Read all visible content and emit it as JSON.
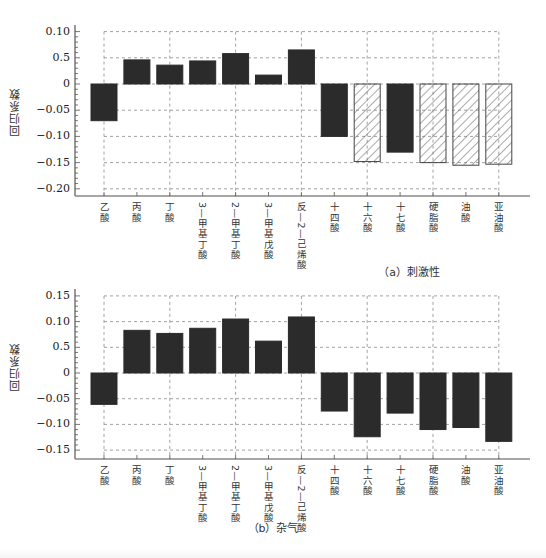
{
  "chart_data": [
    {
      "type": "bar",
      "title": "(a) 刺激性",
      "xlabel": "",
      "ylabel": "回归系数",
      "categories": [
        "乙酸",
        "丙酸",
        "丁酸",
        "3-甲基丁酸",
        "2-甲基丁酸",
        "3-甲基戊酸",
        "反-2-己烯酸",
        "十四酸",
        "十六酸",
        "十七酸",
        "硬脂酸",
        "油酸",
        "亚油酸"
      ],
      "values": [
        -0.07,
        0.046,
        0.036,
        0.044,
        0.058,
        0.017,
        0.065,
        -0.1,
        -0.148,
        -0.13,
        -0.15,
        -0.155,
        -0.153
      ],
      "bar_style": [
        "solid",
        "solid",
        "solid",
        "solid",
        "solid",
        "solid",
        "solid",
        "solid",
        "hatched",
        "solid",
        "hatched",
        "hatched",
        "hatched"
      ],
      "yticks": [
        0.1,
        0.05,
        0,
        -0.05,
        -0.1,
        -0.15,
        -0.2
      ],
      "ytick_labels": [
        "0.10",
        "0.5",
        "0",
        "-0.05",
        "-0.10",
        "-0.15",
        "-0.20"
      ],
      "ylim": [
        -0.21,
        0.11
      ],
      "grid": true,
      "legend": null
    },
    {
      "type": "bar",
      "title": "(b) 杂气",
      "xlabel": "",
      "ylabel": "回归系数",
      "categories": [
        "乙酸",
        "丙酸",
        "丁酸",
        "3-甲基丁酸",
        "2-甲基丁酸",
        "3-甲基戊酸",
        "反-2-己烯酸",
        "十四酸",
        "十六酸",
        "十七酸",
        "硬脂酸",
        "油酸",
        "亚油酸"
      ],
      "values": [
        -0.061,
        0.083,
        0.077,
        0.087,
        0.105,
        0.062,
        0.109,
        -0.074,
        -0.124,
        -0.078,
        -0.11,
        -0.106,
        -0.133
      ],
      "bar_style": [
        "solid",
        "solid",
        "solid",
        "solid",
        "solid",
        "solid",
        "solid",
        "solid",
        "solid",
        "solid",
        "solid",
        "solid",
        "solid"
      ],
      "yticks": [
        0.15,
        0.1,
        0.05,
        0,
        -0.05,
        -0.1,
        -0.15
      ],
      "ytick_labels": [
        "0.15",
        "0.10",
        "0.5",
        "0",
        "-0.05",
        "-0.10",
        "-0.15"
      ],
      "ylim": [
        -0.165,
        0.16
      ],
      "grid": true,
      "legend": null
    }
  ],
  "colors": {
    "bar": "#2b2b2b",
    "grid": "#8a8a8a",
    "axis": "#555555",
    "hatch": "#555555"
  },
  "captions": {
    "a": "（a）刺激性",
    "b": "（b）杂气"
  },
  "ylabel": "回归系数"
}
